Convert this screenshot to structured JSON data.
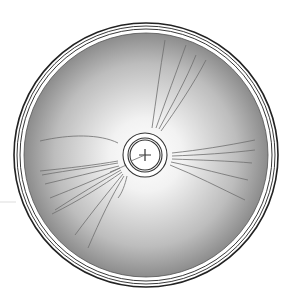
{
  "diagram": {
    "type": "particle-track-chamber",
    "canvas": {
      "width": 290,
      "height": 303,
      "background": "#ffffff"
    },
    "chamber": {
      "cx": 146,
      "cy": 155,
      "outer_rim_r": 132,
      "rim_inner_r": 129,
      "rim_second_r": 126,
      "disk_r": 122,
      "disk_center_color": "#ffffff",
      "disk_edge_color": "#8c8c8c",
      "rim_stroke": "#222222"
    },
    "source": {
      "cx": 145,
      "cy": 155,
      "ring_outer_r": 22,
      "ring_mid_r": 17,
      "ring_inner_r": 15,
      "cross_half": 6,
      "stroke": "#333333"
    },
    "track_color": "#6f6f6f",
    "outside_mark": {
      "x1": 0,
      "y1": 202,
      "x2": 16,
      "y2": 202,
      "color": "#dddddd"
    },
    "tracks": [
      "M152 128 C156 100 160 70 165 40",
      "M156 128 C166 100 177 70 186 45",
      "M159 129 C172 105 186 80 196 55",
      "M161 131 C176 110 193 85 206 60",
      "M40 141 C70 134 100 134 118 143",
      "M118 161 C95 165 70 168 40 171",
      "M118 163 C95 167 70 170 42 175",
      "M119 166 C95 172 70 178 45 184",
      "M120 168 C100 178 75 188 50 198",
      "M121 170 C100 182 78 195 55 210",
      "M122 172 C102 186 80 200 52 214",
      "M123 174 C110 190 95 208 75 235",
      "M124 176 C112 195 100 220 88 248",
      "M127 176 C125 185 122 193 118 198",
      "M132 162 C125 166 115 170 110 172",
      "M172 153 C200 150 225 146 255 140",
      "M172 156 C200 155 230 153 255 150",
      "M172 159 C200 160 230 161 252 163",
      "M171 162 C200 168 225 175 248 180",
      "M170 165 C195 175 220 188 245 200"
    ]
  }
}
